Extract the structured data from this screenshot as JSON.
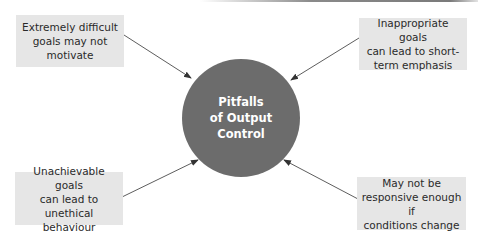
{
  "diagram": {
    "center": {
      "label_lines": [
        "Pitfalls",
        "of Output",
        "Control"
      ],
      "color": "#6c6c6c"
    },
    "boxes": [
      {
        "position": "top-left",
        "lines": [
          "Extremely difficult",
          "goals may not",
          "motivate"
        ]
      },
      {
        "position": "top-right",
        "lines": [
          "Inappropriate goals",
          "can lead to short-",
          "term emphasis"
        ]
      },
      {
        "position": "bottom-left",
        "lines": [
          "Unachievable goals",
          "can lead to unethical",
          "behaviour"
        ]
      },
      {
        "position": "bottom-right",
        "lines": [
          "May not be",
          "responsive enough if",
          "conditions change"
        ]
      }
    ],
    "box_color": "#e6e6e6",
    "arrow_color": "#333333"
  }
}
